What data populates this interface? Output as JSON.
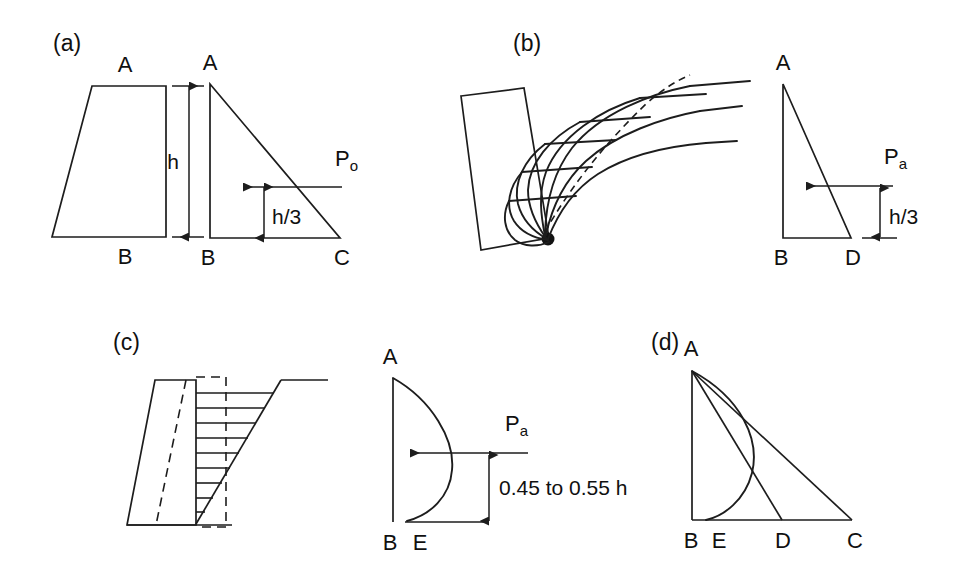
{
  "figure": {
    "background_color": "#ffffff",
    "line_color": "#1d1d1d",
    "panels": [
      {
        "id": "a",
        "label": "(a)",
        "caption": "At-rest condition: rigid wall, triangular pressure diagram ABC",
        "wall": {
          "type": "trapezoid-wall",
          "vertex_top": "A",
          "vertex_bottom": "B"
        },
        "dimension": {
          "label": "h",
          "description": "full wall height"
        },
        "pressure_diagram": {
          "shape": "triangle",
          "vertices": [
            "A",
            "B",
            "C"
          ],
          "force_label": "P",
          "force_subscript": "o",
          "force_full": "Po",
          "resultant_height_label": "h/3",
          "arrow_direction": "left"
        }
      },
      {
        "id": "b",
        "label": "(b)",
        "caption": "Active condition by wall rotation about the toe: triangular pressure diagram ABD",
        "wall": {
          "type": "rotated-wall",
          "pivot": "toe-point",
          "slip_lines": 8,
          "failure_surface": "dashed"
        },
        "pressure_diagram": {
          "shape": "triangle",
          "vertices": [
            "A",
            "B",
            "D"
          ],
          "force_label": "P",
          "force_subscript": "a",
          "force_full": "Pa",
          "resultant_height_label": "h/3",
          "arrow_direction": "left"
        }
      },
      {
        "id": "c",
        "label": "(c)",
        "caption": "Active condition by wall translation/arching: bulged pressure diagram ABE",
        "wall": {
          "type": "translating-wall",
          "deflected_position": "dashed",
          "hatch_lines": 10,
          "boundary": "dashed-rectangle"
        },
        "pressure_diagram": {
          "shape": "bulged-curve",
          "vertices": [
            "A",
            "B",
            "E"
          ],
          "force_label": "P",
          "force_subscript": "a",
          "force_full": "Pa",
          "resultant_height_label": "0.45 to 0.55 h",
          "arrow_direction": "left"
        }
      },
      {
        "id": "d",
        "label": "(d)",
        "caption": "Superimposed comparison of the three pressure distributions",
        "pressure_diagram": {
          "shape": "superimposed",
          "vertices": [
            "A",
            "B",
            "E",
            "D",
            "C"
          ],
          "curves": [
            "A-C straight",
            "A-D straight",
            "A-E bulged"
          ]
        }
      }
    ],
    "labels": {
      "panel_a": "(a)",
      "panel_b": "(b)",
      "panel_c": "(c)",
      "panel_d": "(d)",
      "vertex_A": "A",
      "vertex_B": "B",
      "vertex_C": "C",
      "vertex_D": "D",
      "vertex_E": "E",
      "height_h": "h",
      "third_height": "h/3",
      "bulge_height": "0.45 to 0.55 h",
      "force_P": "P",
      "sub_o": "o",
      "sub_a": "a"
    }
  }
}
